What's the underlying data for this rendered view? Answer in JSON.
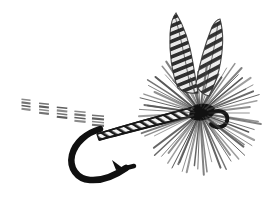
{
  "image": {
    "kind": "line-art-illustration",
    "subject": "dry fly fishing lure",
    "title": "Dry Fly",
    "background_color": "#ffffff",
    "ink_color": "#1a1a1a",
    "mid_tone_color": "#555555",
    "light_tone_color": "#8a8a8a",
    "width_px": 262,
    "height_px": 201,
    "style": "black and white halftone / scanned engraving"
  },
  "parts": {
    "wings": {
      "label": "Barred upright divided wings",
      "count": 2,
      "pattern": "barred / grizzly mottled",
      "color_dark": "#333333",
      "color_light": "#ededed",
      "left_wing": {
        "label": "Left wing",
        "tip_x": 176,
        "tip_y": 14,
        "base_x": 196,
        "base_y": 92,
        "bar_count": 11,
        "lean_deg": -8
      },
      "right_wing": {
        "label": "Right wing",
        "tip_x": 219,
        "tip_y": 19,
        "base_x": 205,
        "base_y": 95,
        "bar_count": 11,
        "lean_deg": 9
      }
    },
    "hackle": {
      "label": "Radial hackle collar",
      "center_x": 200,
      "center_y": 113,
      "fiber_count": 72,
      "radius_min": 34,
      "radius_max": 62,
      "color": "#4a4a4a",
      "note": "dense dry-fly hackle radiating around the head"
    },
    "head": {
      "label": "Thread head",
      "center_x": 203,
      "center_y": 114,
      "rx": 12,
      "ry": 7,
      "color": "#111111"
    },
    "eye": {
      "label": "Hook eye",
      "center_x": 221,
      "center_y": 118,
      "r": 7,
      "color": "#1a1a1a"
    },
    "body": {
      "label": "Ribbed segmented body",
      "start_x": 96,
      "start_y": 128,
      "end_x": 196,
      "end_y": 108,
      "rib_count": 22,
      "thickness": 9,
      "color_outline": "#1f1f1f",
      "color_fill": "#f2f2f2"
    },
    "hook": {
      "label": "Hook with bend, point and barb",
      "shank_start_x": 96,
      "shank_start_y": 130,
      "bend_bottom_x": 95,
      "bend_bottom_y": 176,
      "point_x": 132,
      "point_y": 168,
      "barb_x": 120,
      "barb_y": 160,
      "color": "#101010",
      "line_width": 6
    },
    "tail": {
      "label": "Split tail fiber clusters",
      "cluster_count": 5,
      "start_x": 26,
      "start_y": 104,
      "end_x": 98,
      "end_y": 120,
      "fibers_per_cluster": 4,
      "color": "#3c3c3c"
    }
  },
  "caption": {
    "visible": false,
    "text": ""
  }
}
